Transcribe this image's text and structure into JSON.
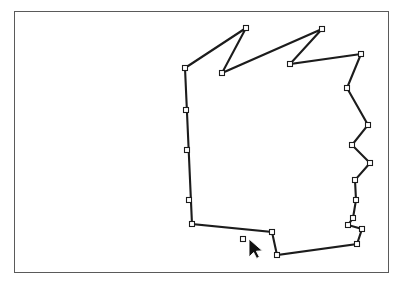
{
  "app": {
    "title": "Polygon Editor Canvas",
    "background_color": "#ffffff"
  },
  "canvas": {
    "name": "drawing-canvas",
    "frame": {
      "x": 14,
      "y": 11,
      "width": 375,
      "height": 262
    },
    "border_color": "#5a5a5a",
    "fill_color": "#ffffff"
  },
  "shape": {
    "name": "editable-polygon",
    "type": "closed-polygon",
    "stroke_color": "#1c1c1c",
    "stroke_width": 2,
    "fill": "none",
    "vertex_count": 24,
    "vertex_marker": {
      "shape": "square",
      "size": 5,
      "fill_color": "#ffffff",
      "stroke_color": "#1c1c1c"
    },
    "points": [
      [
        185,
        68
      ],
      [
        246,
        28
      ],
      [
        222,
        73
      ],
      [
        322,
        29
      ],
      [
        290,
        64
      ],
      [
        361,
        54
      ],
      [
        347,
        88
      ],
      [
        368,
        125
      ],
      [
        352,
        145
      ],
      [
        370,
        163
      ],
      [
        355,
        180
      ],
      [
        356,
        200
      ],
      [
        353,
        218
      ],
      [
        348,
        225
      ],
      [
        362,
        229
      ],
      [
        357,
        244
      ],
      [
        277,
        255
      ],
      [
        272,
        232
      ],
      [
        243,
        239
      ],
      [
        192,
        224
      ],
      [
        189,
        200
      ],
      [
        187,
        150
      ],
      [
        186,
        110
      ]
    ],
    "path_d": "M 185 68 L 246 28 L 222 73 L 322 29 L 290 64 L 361 54 L 347 88 L 368 125 L 352 145 L 370 163 L 355 180 L 356 200 L 353 218 L 348 225 L 362 229 L 357 244 L 277 255 L 272 232 L 192 224 Z"
  },
  "cursor": {
    "name": "mouse-pointer",
    "type": "arrow",
    "tip_x": 249,
    "tip_y": 239,
    "fill_color": "#111111",
    "outline_color": "#ffffff"
  }
}
